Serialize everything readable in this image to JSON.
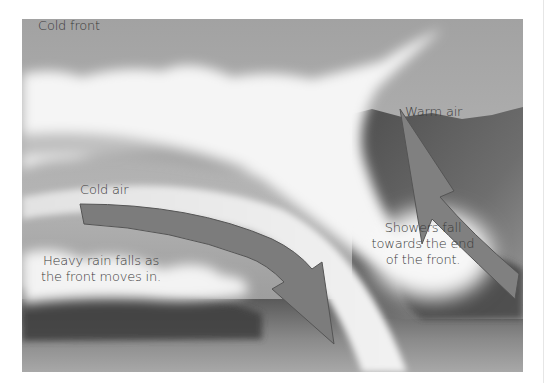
{
  "diagram": {
    "title": "Cold front",
    "labels": {
      "cold_front": "Cold front",
      "warm_air": "Warm air",
      "cold_air": "Cold air",
      "heavy_rain": [
        "Heavy rain falls as",
        "the front moves in."
      ],
      "showers": [
        "Showers fall",
        "towards the end",
        "of the front."
      ]
    },
    "elements": {
      "cold_air_arrow": "arrow-down-right",
      "warm_air_arrow": "arrow-up-left",
      "front_boundary": "curved-wedge",
      "clouds": "cloud-band",
      "rain": "rain-streaks"
    },
    "colors": {
      "sky": "#a9a9a9",
      "cloud": "#f4f4f4",
      "arrow_fill": "#7e7e7e",
      "arrow_stroke": "#555555",
      "warm_hill": "#6a6a6a",
      "rain": "#3c3c3c",
      "text": "#3a3a3a"
    }
  }
}
